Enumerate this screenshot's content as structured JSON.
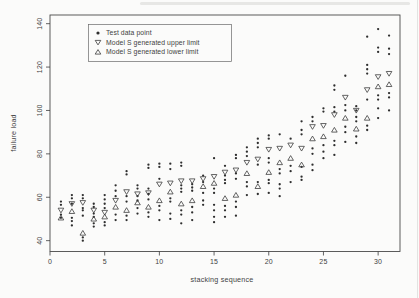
{
  "figure": {
    "background": "#fbfbfa",
    "ink": "#3f3f3f"
  },
  "chart_data": {
    "type": "scatter",
    "title": "",
    "xlabel": "stacking sequence",
    "ylabel": "failure load",
    "xlim": [
      0,
      32
    ],
    "ylim": [
      35,
      144
    ],
    "xticks": [
      0,
      5,
      10,
      15,
      20,
      25,
      30
    ],
    "yticks": [
      40,
      60,
      80,
      100,
      120,
      140
    ],
    "grid": false,
    "legend_position": "top-left-inside",
    "legend": [
      {
        "marker": "filled-dot",
        "label": "Test data point"
      },
      {
        "marker": "open-triangle-down",
        "label": "Model S generated upper limit"
      },
      {
        "marker": "open-triangle-up",
        "label": "Model S generated lower limit"
      }
    ],
    "sequences": [
      {
        "seq": 1,
        "tests": [
          58,
          56.5,
          52,
          50.5
        ],
        "upper": 54,
        "lower": 50.5
      },
      {
        "seq": 2,
        "tests": [
          61,
          59.5,
          57,
          50.5,
          49,
          47
        ],
        "upper": 57,
        "lower": 53.5
      },
      {
        "seq": 3,
        "tests": [
          61,
          59.5,
          55,
          54,
          51.5,
          41.5,
          40
        ],
        "upper": 57.5,
        "lower": 43.5
      },
      {
        "seq": 4,
        "tests": [
          57,
          55.5,
          52.5,
          51,
          48,
          46.5
        ],
        "upper": 54,
        "lower": 50
      },
      {
        "seq": 5,
        "tests": [
          61,
          59,
          57,
          55,
          48.5,
          47
        ],
        "upper": 53,
        "lower": 51
      },
      {
        "seq": 6,
        "tests": [
          65.5,
          63,
          60.5,
          52,
          49.5
        ],
        "upper": 58.5,
        "lower": 55.5
      },
      {
        "seq": 7,
        "tests": [
          72,
          70.5,
          60.5,
          58,
          51.5,
          49.5
        ],
        "upper": 62.5,
        "lower": 54
      },
      {
        "seq": 8,
        "tests": [
          65.5,
          64,
          60.5,
          58.5,
          55,
          52.5
        ],
        "upper": 61.5,
        "lower": 57.5
      },
      {
        "seq": 9,
        "tests": [
          75,
          73.5,
          64,
          61.5,
          59,
          53,
          51
        ],
        "upper": 62,
        "lower": 55.5
      },
      {
        "seq": 10,
        "tests": [
          75.5,
          74,
          68.5,
          56,
          54,
          49.5
        ],
        "upper": 66,
        "lower": 58.5
      },
      {
        "seq": 11,
        "tests": [
          75.5,
          73,
          59.5,
          58,
          52.5,
          50
        ],
        "upper": 66.5,
        "lower": 62.5
      },
      {
        "seq": 12,
        "tests": [
          76,
          74.5,
          65.5,
          64,
          62.5,
          54,
          52,
          48
        ],
        "upper": 67.5,
        "lower": 57
      },
      {
        "seq": 13,
        "tests": [
          66,
          64.5,
          63,
          55.5,
          53,
          49.5
        ],
        "upper": 67.5,
        "lower": 58.5
      },
      {
        "seq": 14,
        "tests": [
          70,
          67,
          62,
          58.5,
          56.5
        ],
        "upper": 68.5,
        "lower": 65
      },
      {
        "seq": 15,
        "tests": [
          78,
          64,
          62,
          56.5,
          54,
          51,
          48.5
        ],
        "upper": 69.5,
        "lower": 66.5
      },
      {
        "seq": 16,
        "tests": [
          74.5,
          70,
          68,
          66.5,
          56,
          54,
          51
        ],
        "upper": 71.5,
        "lower": 59.5
      },
      {
        "seq": 17,
        "tests": [
          79.5,
          78,
          71,
          68.5,
          58,
          55.5,
          51.5
        ],
        "upper": 72.5,
        "lower": 61
      },
      {
        "seq": 18,
        "tests": [
          83,
          81,
          79,
          67,
          65,
          61
        ],
        "upper": 76,
        "lower": 71
      },
      {
        "seq": 19,
        "tests": [
          87,
          85,
          83,
          75,
          67,
          61.5
        ],
        "upper": 77.5,
        "lower": 65
      },
      {
        "seq": 20,
        "tests": [
          88.5,
          87,
          78,
          76,
          68,
          66.5,
          62
        ],
        "upper": 82,
        "lower": 71.5
      },
      {
        "seq": 21,
        "tests": [
          89,
          73,
          71,
          66,
          64,
          60.5
        ],
        "upper": 82.5,
        "lower": 76
      },
      {
        "seq": 22,
        "tests": [
          87,
          74.5,
          72,
          67
        ],
        "upper": 84,
        "lower": 78
      },
      {
        "seq": 23,
        "tests": [
          95,
          91,
          89,
          74,
          69.5,
          68
        ],
        "upper": 82.5,
        "lower": 75
      },
      {
        "seq": 24,
        "tests": [
          97,
          95,
          82.5,
          80,
          75,
          72.5
        ],
        "upper": 92.5,
        "lower": 87
      },
      {
        "seq": 25,
        "tests": [
          101,
          99.5,
          84,
          81,
          78
        ],
        "upper": 93,
        "lower": 88
      },
      {
        "seq": 26,
        "tests": [
          111.5,
          109.5,
          101.5,
          99.5,
          86,
          84,
          79.5
        ],
        "upper": 98,
        "lower": 91
      },
      {
        "seq": 27,
        "tests": [
          116,
          102.5,
          100,
          92.5,
          90,
          85.5
        ],
        "upper": 106,
        "lower": 96.5
      },
      {
        "seq": 28,
        "tests": [
          102,
          100,
          97,
          95,
          88,
          85
        ],
        "upper": 100,
        "lower": 91.5
      },
      {
        "seq": 29,
        "tests": [
          134,
          121,
          119,
          117,
          105,
          93,
          91
        ],
        "upper": 109.5,
        "lower": 96.5
      },
      {
        "seq": 30,
        "tests": [
          137.5,
          129,
          127,
          107,
          105,
          101,
          96.5
        ],
        "upper": 115.5,
        "lower": 111
      },
      {
        "seq": 31,
        "tests": [
          134.5,
          128.5,
          126,
          108,
          106,
          100
        ],
        "upper": 117,
        "lower": 112
      }
    ]
  }
}
